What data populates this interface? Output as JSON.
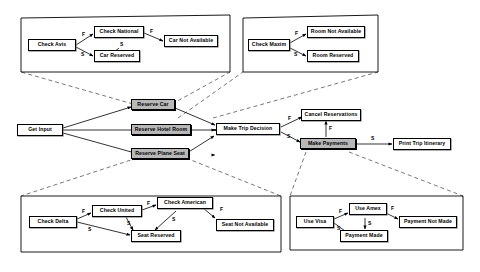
{
  "diagram": {
    "colors": {
      "line": "#000000",
      "node_fill": "#ffffff",
      "shaded_node_fill": "#b8b8b8",
      "dashed_link": "#555555",
      "container_border": "#000000"
    },
    "edge_labels": {
      "failure": "F",
      "success": "S"
    }
  },
  "containers": [
    {
      "id": "car-subdiagram",
      "name": "car-reservation-subdiagram"
    },
    {
      "id": "hotel-subdiagram",
      "name": "hotel-reservation-subdiagram"
    },
    {
      "id": "flight-subdiagram",
      "name": "flight-reservation-subdiagram"
    },
    {
      "id": "payment-subdiagram",
      "name": "payment-subdiagram"
    }
  ],
  "nodes": {
    "check_avis": "Check Avis",
    "check_national": "Check National",
    "car_reserved": "Car Reserved",
    "car_not_available": "Car Not Available",
    "check_maxim": "Check Maxim",
    "room_not_available": "Room Not Available",
    "room_reserved": "Room Reserved",
    "get_input": "Get Input",
    "reserve_car": "Reserve Car",
    "reserve_hotel_room": "Reserve Hotel Room",
    "reserve_plane_seat": "Reserve Plane Seat",
    "make_trip_decision": "Make Trip Decision",
    "cancel_reservations": "Cancel Reservations",
    "make_payments": "Make Payments",
    "print_trip_itinerary": "Print Trip Itinerary",
    "check_delta": "Check Delta",
    "check_united": "Check United",
    "check_american": "Check American",
    "seat_reserved": "Seat Reserved",
    "seat_not_available": "Seat Not Available",
    "use_visa": "Use Visa",
    "use_amex": "Use Amex",
    "payment_made": "Payment Made",
    "payment_not_made": "Payment Not Made"
  },
  "labels": {
    "avis_f": "F",
    "avis_s": "S",
    "national_f": "F",
    "national_s": "S",
    "maxim_f": "F",
    "maxim_s": "S",
    "decision_f": "F",
    "decision_s": "S",
    "payments_f": "F",
    "payments_s": "S",
    "delta_f": "F",
    "delta_s": "S",
    "united_f": "F",
    "united_s": "S",
    "american_f": "F",
    "american_s": "S",
    "visa_f": "F",
    "visa_s": "S",
    "amex_f": "F",
    "amex_s": "S"
  }
}
